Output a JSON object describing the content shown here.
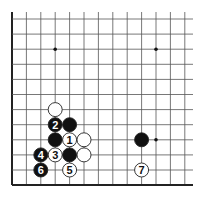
{
  "diagram": {
    "type": "go-board-fragment",
    "grid": {
      "x0": 12,
      "y0": 19,
      "spacing_x": 14.4,
      "spacing_y": 15.1,
      "cols": 13,
      "rows": 12,
      "top_y": 12,
      "right_x": 193,
      "edges": [
        "left",
        "bottom"
      ],
      "line_color": "#555555",
      "edge_color": "#222222"
    },
    "star_points": [
      {
        "col": 3,
        "row": 2
      },
      {
        "col": 10,
        "row": 2
      },
      {
        "col": 10,
        "row": 8
      }
    ],
    "stones": [
      {
        "col": 3,
        "row": 6,
        "color": "white",
        "label": ""
      },
      {
        "col": 3,
        "row": 7,
        "color": "black",
        "label": "2"
      },
      {
        "col": 4,
        "row": 7,
        "color": "black",
        "label": ""
      },
      {
        "col": 3,
        "row": 8,
        "color": "black",
        "label": ""
      },
      {
        "col": 4,
        "row": 8,
        "color": "white",
        "label": "1"
      },
      {
        "col": 5,
        "row": 8,
        "color": "white",
        "label": ""
      },
      {
        "col": 9,
        "row": 8,
        "color": "black",
        "label": ""
      },
      {
        "col": 2,
        "row": 9,
        "color": "black",
        "label": "4"
      },
      {
        "col": 3,
        "row": 9,
        "color": "white",
        "label": "3"
      },
      {
        "col": 4,
        "row": 9,
        "color": "black",
        "label": ""
      },
      {
        "col": 5,
        "row": 9,
        "color": "white",
        "label": ""
      },
      {
        "col": 2,
        "row": 10,
        "color": "black",
        "label": "6"
      },
      {
        "col": 4,
        "row": 10,
        "color": "white",
        "label": "5"
      },
      {
        "col": 9,
        "row": 10,
        "color": "white",
        "label": "7"
      }
    ],
    "colors": {
      "black_stone": "#111111",
      "white_stone": "#ffffff",
      "stone_outline": "#222222"
    }
  }
}
